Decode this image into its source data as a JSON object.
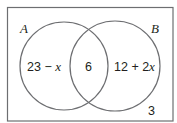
{
  "diagram": {
    "type": "venn",
    "sets": [
      {
        "name": "A",
        "only_region": {
          "expr_prefix": "23 − ",
          "variable": "x",
          "expr_suffix": ""
        }
      },
      {
        "name": "B",
        "only_region": {
          "expr_prefix": "12 + 2",
          "variable": "x",
          "expr_suffix": ""
        }
      }
    ],
    "intersection": "6",
    "outside": "3",
    "colors": {
      "stroke": "#6d6e71",
      "text": "#231f20",
      "background": "#ffffff"
    }
  }
}
